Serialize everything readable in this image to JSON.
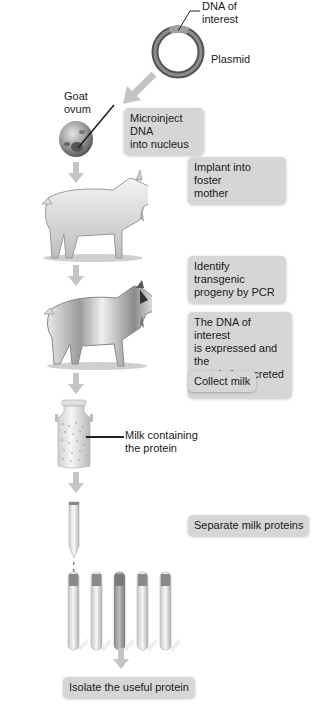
{
  "diagram": {
    "title": "",
    "colors": {
      "box_fill": "#d6d6d6",
      "arrow": "#b8b8b8",
      "plasmid_ring": "#5a5a5a",
      "text": "#1a1a1a"
    },
    "labels": {
      "dna_of_interest": "DNA of interest",
      "dna_line1": "DNA of",
      "dna_line2": "interest",
      "plasmid": "Plasmid",
      "goat_ovum_line1": "Goat",
      "goat_ovum_line2": "ovum",
      "milk_line1": "Milk containing",
      "milk_line2": "the protein"
    },
    "steps": [
      {
        "id": "microinject",
        "line1": "Microinject DNA",
        "line2": "into nucleus"
      },
      {
        "id": "implant",
        "line1": "Implant into foster",
        "line2": "mother"
      },
      {
        "id": "identify",
        "line1": "Identify transgenic",
        "line2": "progeny by PCR"
      },
      {
        "id": "expressed",
        "line1": "The DNA of interest",
        "line2": "is expressed and the",
        "line3": "protein is secreted",
        "line4": "into the milk"
      },
      {
        "id": "collect",
        "line1": "Collect milk"
      },
      {
        "id": "separate",
        "line1": "Separate milk proteins"
      },
      {
        "id": "isolate",
        "line1": "Isolate the useful protein"
      }
    ],
    "icons": [
      "plasmid-icon",
      "goat-ovum-icon",
      "micropipette-icon",
      "goat-icon",
      "transgenic-goat-icon",
      "milk-can-icon",
      "chromatography-column-icon",
      "test-tube-icon",
      "down-arrow-icon"
    ]
  }
}
